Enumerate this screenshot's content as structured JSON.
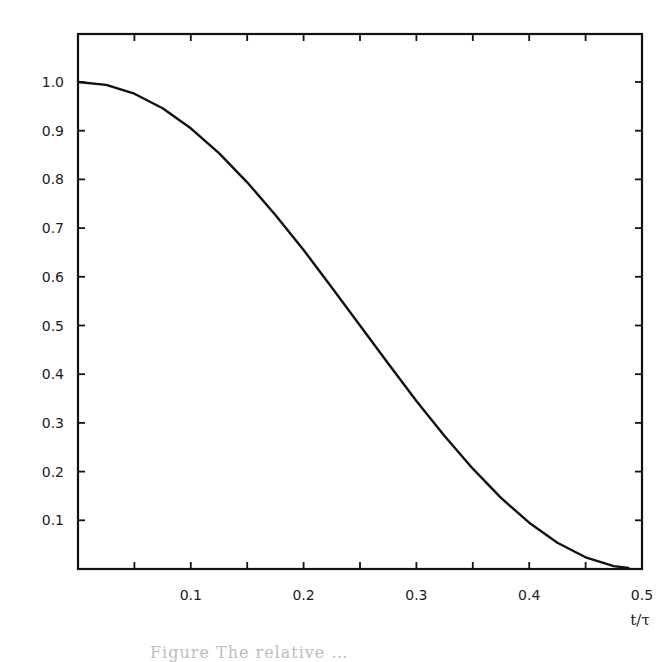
{
  "chart_data": {
    "type": "line",
    "title": "",
    "xlabel": "t/τ",
    "ylabel": "",
    "xlim": [
      0,
      0.5
    ],
    "ylim": [
      0,
      1.1
    ],
    "grid": false,
    "legend": null,
    "x_ticks": [
      0.1,
      0.2,
      0.3,
      0.4,
      0.5
    ],
    "x_tick_labels": [
      "0.1",
      "0.2",
      "0.3",
      "0.4",
      "0.5"
    ],
    "x_minor_ticks": [
      0.05,
      0.15,
      0.25,
      0.35,
      0.45
    ],
    "y_ticks": [
      0.1,
      0.2,
      0.3,
      0.4,
      0.5,
      0.6,
      0.7,
      0.8,
      0.9,
      1.0
    ],
    "y_tick_labels": [
      "0.1",
      "0.2",
      "0.3",
      "0.4",
      "0.5",
      "0.6",
      "0.7",
      "0.8",
      "0.9",
      "1.0"
    ],
    "series": [
      {
        "name": "curve",
        "color": "#111111",
        "x": [
          0,
          0.025,
          0.05,
          0.075,
          0.1,
          0.125,
          0.15,
          0.175,
          0.2,
          0.225,
          0.25,
          0.275,
          0.3,
          0.325,
          0.35,
          0.375,
          0.4,
          0.425,
          0.45,
          0.475,
          0.488
        ],
        "y": [
          1.0,
          0.994,
          0.976,
          0.946,
          0.905,
          0.854,
          0.794,
          0.727,
          0.655,
          0.578,
          0.5,
          0.422,
          0.345,
          0.273,
          0.206,
          0.146,
          0.095,
          0.054,
          0.024,
          0.006,
          0.002
        ]
      }
    ]
  },
  "caption": {
    "text": "Figure  The  relative …"
  }
}
